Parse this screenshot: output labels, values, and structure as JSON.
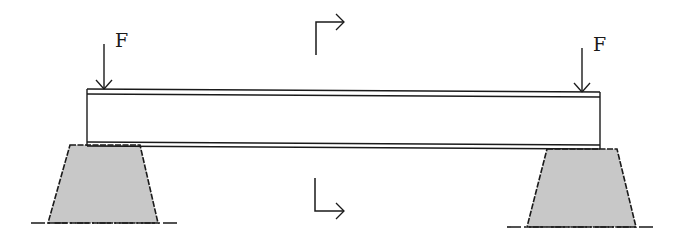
{
  "diagram": {
    "type": "simply-supported beam with two point loads",
    "loads": [
      {
        "label": "F",
        "position": "left end"
      },
      {
        "label": "F",
        "position": "right end"
      }
    ],
    "section_marker": {
      "description": "section cut arrows at mid-span pointing right"
    },
    "supports": [
      {
        "name": "left-support",
        "shape": "trapezoid",
        "fill": "#c8c8c8"
      },
      {
        "name": "right-support",
        "shape": "trapezoid",
        "fill": "#c8c8c8"
      }
    ],
    "colors": {
      "line": "#1a1a1a",
      "support_fill": "#c8c8c8",
      "background": "#ffffff"
    }
  }
}
